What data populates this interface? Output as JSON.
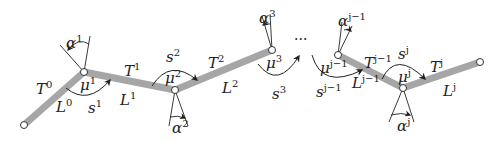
{
  "diagram": {
    "type": "serial-chain-linkage",
    "colors": {
      "link": "#a6a6a6",
      "joint_fill": "#ffffff",
      "stroke": "#222222"
    },
    "ellipsis": "···",
    "links": [
      {
        "T": {
          "base": "T",
          "sup": "0"
        },
        "L": {
          "base": "L",
          "sup": "0"
        }
      },
      {
        "T": {
          "base": "T",
          "sup": "1"
        },
        "L": {
          "base": "L",
          "sup": "1"
        }
      },
      {
        "T": {
          "base": "T",
          "sup": "2"
        },
        "L": {
          "base": "L",
          "sup": "2"
        }
      },
      {
        "T": {
          "base": "T",
          "sup": "j−1"
        },
        "L": {
          "base": "L",
          "sup": "j−1"
        }
      },
      {
        "T": {
          "base": "T",
          "sup": "j"
        },
        "L": {
          "base": "L",
          "sup": "j"
        }
      }
    ],
    "joints": [
      {
        "mu": {
          "base": "μ",
          "sup": "1"
        },
        "alpha": {
          "base": "α",
          "sup": "1"
        },
        "s": {
          "base": "s",
          "sup": "1"
        }
      },
      {
        "mu": {
          "base": "μ",
          "sup": "2"
        },
        "alpha": {
          "base": "α",
          "sup": "2"
        },
        "s": {
          "base": "s",
          "sup": "2"
        }
      },
      {
        "mu": {
          "base": "μ",
          "sup": "3"
        },
        "alpha": {
          "base": "α",
          "sup": "3"
        },
        "s": {
          "base": "s",
          "sup": "3"
        }
      },
      {
        "mu": {
          "base": "μ",
          "sup": "j−1"
        },
        "alpha": {
          "base": "α",
          "sup": "j−1"
        },
        "s": {
          "base": "s",
          "sup": "j−1"
        }
      },
      {
        "mu": {
          "base": "μ",
          "sup": "j"
        },
        "alpha": {
          "base": "α",
          "sup": "j"
        },
        "s": {
          "base": "s",
          "sup": "j"
        }
      }
    ]
  }
}
